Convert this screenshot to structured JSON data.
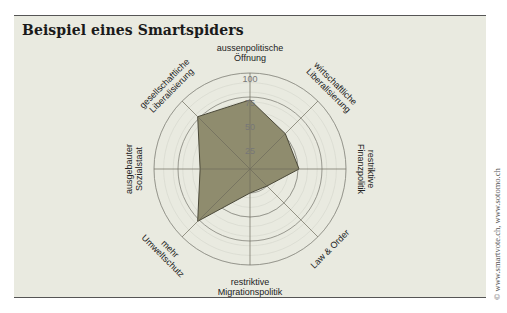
{
  "title": "Beispiel eines Smartspiders",
  "copyright": "© www.smartvote.ch, www.sotomo.ch",
  "colors": {
    "panel_bg": "#e9eae0",
    "polygon_fill": "#8f8c6e",
    "polygon_stroke": "#4a4838",
    "grid": "#8e8e86"
  },
  "chart_data": {
    "type": "radar",
    "title": "Beispiel eines Smartspiders",
    "range": [
      0,
      100
    ],
    "ticks": [
      "25",
      "50",
      "75",
      "100"
    ],
    "axes": [
      {
        "label_lines": [
          "aussenpolitische",
          "Öffnung"
        ],
        "value": 72
      },
      {
        "label_lines": [
          "wirtschaftliche",
          "Liberalisierung"
        ],
        "value": 52
      },
      {
        "label_lines": [
          "restriktive",
          "Finanzpolitik"
        ],
        "value": 51
      },
      {
        "label_lines": [
          "Law & Order"
        ],
        "value": 25
      },
      {
        "label_lines": [
          "restriktive",
          "Migrationspolitik"
        ],
        "value": 25
      },
      {
        "label_lines": [
          "mehr",
          "Umweltschutz"
        ],
        "value": 77
      },
      {
        "label_lines": [
          "ausgebauter",
          "Sozialstaat"
        ],
        "value": 52
      },
      {
        "label_lines": [
          "gesellschaftliche",
          "Liberalisierung"
        ],
        "value": 77
      }
    ],
    "minor_grid_step": 10,
    "legend": "none"
  }
}
